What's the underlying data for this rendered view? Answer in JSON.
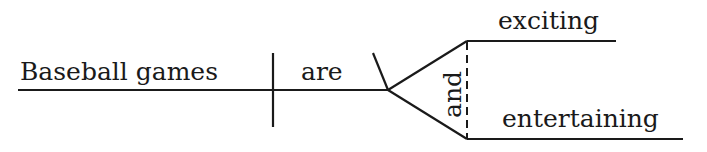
{
  "diagram": {
    "type": "sentence-diagram",
    "sentence": "Baseball games are exciting and entertaining",
    "subject": "Baseball games",
    "verb": "are",
    "conjunction": "and",
    "predicate_adjectives": [
      "exciting",
      "entertaining"
    ],
    "colors": {
      "ink": "#1a1a1a",
      "background": "#ffffff"
    }
  }
}
